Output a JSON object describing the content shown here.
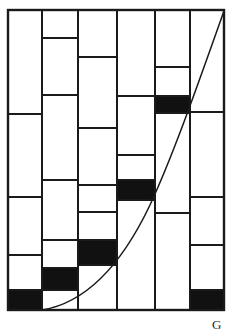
{
  "figure": {
    "label": "G",
    "label_position": {
      "x": 212,
      "y": 317
    },
    "background_color": "#ffffff",
    "line_color": "#1a1a1a",
    "fill_color": "#111111",
    "empty_color": "#ffffff"
  },
  "chart_data": {
    "type": "bar",
    "title": "",
    "subtitle": "",
    "xlabel": "",
    "ylabel": "",
    "grid": false,
    "legend_position": "none",
    "annotations": [
      "G"
    ],
    "axis_box": {
      "left": 8,
      "right": 224,
      "top": 10,
      "bottom": 310
    },
    "categories": [
      "1",
      "2",
      "3",
      "4",
      "5",
      "6"
    ],
    "column_edges_px": [
      8,
      42,
      78,
      117,
      155,
      190,
      224
    ],
    "series": [
      {
        "name": "column-1",
        "top_px": 10,
        "cells": [
          {
            "top": 10,
            "bottom": 114,
            "filled": false
          },
          {
            "top": 114,
            "bottom": 197,
            "filled": false
          },
          {
            "top": 197,
            "bottom": 255,
            "filled": false
          },
          {
            "top": 255,
            "bottom": 290,
            "filled": false
          },
          {
            "top": 290,
            "bottom": 310,
            "filled": true
          }
        ]
      },
      {
        "name": "column-2",
        "top_px": 38,
        "cells": [
          {
            "top": 38,
            "bottom": 95,
            "filled": false
          },
          {
            "top": 95,
            "bottom": 180,
            "filled": false
          },
          {
            "top": 180,
            "bottom": 240,
            "filled": false
          },
          {
            "top": 240,
            "bottom": 268,
            "filled": false
          },
          {
            "top": 268,
            "bottom": 290,
            "filled": true
          },
          {
            "top": 290,
            "bottom": 310,
            "filled": false
          }
        ]
      },
      {
        "name": "column-3",
        "top_px": 10,
        "cells": [
          {
            "top": 10,
            "bottom": 57,
            "filled": false
          },
          {
            "top": 57,
            "bottom": 128,
            "filled": false
          },
          {
            "top": 128,
            "bottom": 185,
            "filled": false
          },
          {
            "top": 185,
            "bottom": 212,
            "filled": false
          },
          {
            "top": 212,
            "bottom": 240,
            "filled": false
          },
          {
            "top": 240,
            "bottom": 265,
            "filled": true
          },
          {
            "top": 265,
            "bottom": 310,
            "filled": false
          }
        ]
      },
      {
        "name": "column-4",
        "top_px": 10,
        "cells": [
          {
            "top": 10,
            "bottom": 96,
            "filled": false
          },
          {
            "top": 96,
            "bottom": 155,
            "filled": false
          },
          {
            "top": 155,
            "bottom": 180,
            "filled": false
          },
          {
            "top": 180,
            "bottom": 200,
            "filled": true
          },
          {
            "top": 200,
            "bottom": 310,
            "filled": false
          }
        ]
      },
      {
        "name": "column-5",
        "top_px": 10,
        "cells": [
          {
            "top": 10,
            "bottom": 67,
            "filled": false
          },
          {
            "top": 67,
            "bottom": 96,
            "filled": false
          },
          {
            "top": 96,
            "bottom": 113,
            "filled": true
          },
          {
            "top": 113,
            "bottom": 213,
            "filled": false
          },
          {
            "top": 213,
            "bottom": 310,
            "filled": false
          }
        ]
      },
      {
        "name": "column-6",
        "top_px": 10,
        "cells": [
          {
            "top": 10,
            "bottom": 112,
            "filled": false
          },
          {
            "top": 112,
            "bottom": 197,
            "filled": false
          },
          {
            "top": 197,
            "bottom": 245,
            "filled": false
          },
          {
            "top": 245,
            "bottom": 290,
            "filled": false
          },
          {
            "top": 290,
            "bottom": 310,
            "filled": true
          }
        ]
      }
    ],
    "curve": {
      "name": "overlay-curve",
      "shape": "convex-increasing",
      "start_px": {
        "x": 42,
        "y": 310
      },
      "end_px": {
        "x": 224,
        "y": 10
      },
      "path": "M 42 310 C 85 303, 120 268, 150 205 C 172 158, 196 90, 224 11"
    }
  }
}
